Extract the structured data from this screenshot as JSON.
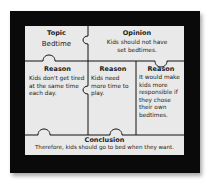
{
  "organizer": {
    "topic": {
      "label": "Topic",
      "text": "Bedtime"
    },
    "opinion": {
      "label": "Opinion",
      "text": "Kids should not have set bedtimes."
    },
    "reasons": [
      {
        "label": "Reason",
        "text": "Kids don't get tired at the same time each day."
      },
      {
        "label": "Reason",
        "text": "Kids need more time to play."
      },
      {
        "label": "Reason",
        "text": "It would make kids more responsible if they chose their own bedtimes."
      }
    ],
    "conclusion": {
      "label": "Conclusion",
      "text": "Therefore, kids should go to bed when they want."
    }
  },
  "colors": {
    "frame": "#0a0a0a",
    "board": "#e9e9e9",
    "ink": "#222222"
  }
}
